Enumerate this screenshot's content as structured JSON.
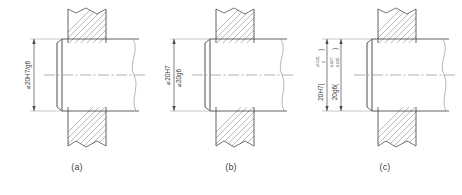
{
  "figure": {
    "title": "",
    "background_color": "#ffffff",
    "line_color": "#3a3a3a",
    "hatch_color": "#7a7a7a",
    "centerline_color": "#8a8a8a"
  },
  "panels": [
    {
      "id": "a",
      "caption": "(a)",
      "dimension_style": "fit-symbol",
      "labels": [
        {
          "name": "fit-designation",
          "text": "⌀20H7/g6",
          "orientation": "vertical"
        }
      ]
    },
    {
      "id": "b",
      "caption": "(b)",
      "dimension_style": "separate-symbols",
      "labels": [
        {
          "name": "hole-designation",
          "text": "⌀20H7",
          "orientation": "vertical"
        },
        {
          "name": "shaft-designation",
          "text": "⌀20g6",
          "orientation": "vertical"
        }
      ]
    },
    {
      "id": "c",
      "caption": "(c)",
      "dimension_style": "symbol-with-deviations",
      "labels": [
        {
          "name": "hole-designation",
          "text": "20H7(",
          "orientation": "vertical",
          "upper_deviation": "+0.021",
          "lower_deviation": "0",
          "close_paren": ")"
        },
        {
          "name": "shaft-designation",
          "text": "20g6(",
          "orientation": "vertical",
          "upper_deviation": "-0.007",
          "lower_deviation": "-0.020",
          "close_paren": ")"
        }
      ]
    }
  ]
}
